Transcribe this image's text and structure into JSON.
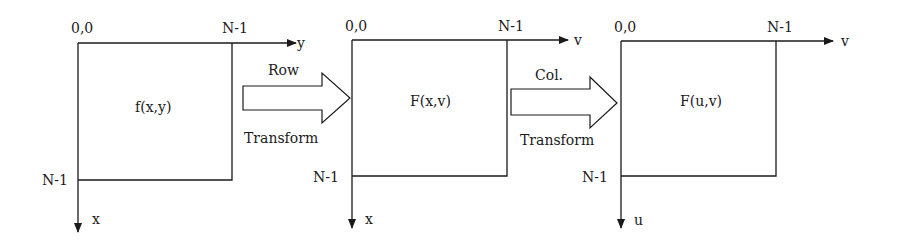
{
  "diagram": {
    "colors": {
      "stroke": "#1a1a1a",
      "background": "#ffffff"
    },
    "panels": [
      {
        "id": "spatial",
        "origin_label": "0,0",
        "top_right_label": "N-1",
        "bottom_left_label": "N-1",
        "horizontal_axis": "y",
        "vertical_axis": "x",
        "function_label": "f(x,y)"
      },
      {
        "id": "row-transformed",
        "origin_label": "0,0",
        "top_right_label": "N-1",
        "bottom_left_label": "N-1",
        "horizontal_axis": "v",
        "vertical_axis": "x",
        "function_label": "F(x,v)"
      },
      {
        "id": "frequency",
        "origin_label": "0,0",
        "top_right_label": "N-1",
        "bottom_left_label": "N-1",
        "horizontal_axis": "v",
        "vertical_axis": "u",
        "function_label": "F(u,v)"
      }
    ],
    "arrows": [
      {
        "id": "row-transform",
        "top_label": "Row",
        "bottom_label": "Transform"
      },
      {
        "id": "col-transform",
        "top_label": "Col.",
        "bottom_label": "Transform"
      }
    ]
  }
}
